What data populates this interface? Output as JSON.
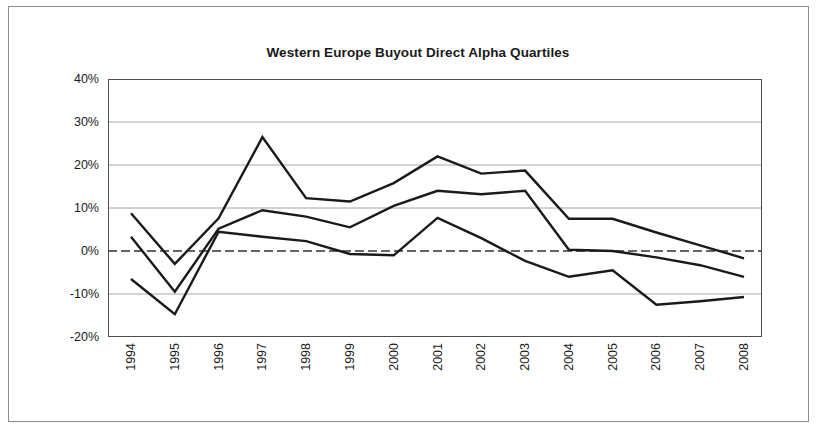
{
  "figure": {
    "title": "Western Europe Buyout Direct Alpha Quartiles"
  },
  "axis": {
    "y_ticks": [
      "40%",
      "30%",
      "20%",
      "10%",
      "0%",
      "-10%",
      "-20%"
    ],
    "x_ticks": [
      "1994",
      "1995",
      "1996",
      "1997",
      "1998",
      "1999",
      "2000",
      "2001",
      "2002",
      "2003",
      "2004",
      "2005",
      "2006",
      "2007",
      "2008"
    ]
  },
  "colors": {
    "line": "#1a1a1a",
    "grid": "#a6a6a6",
    "zero_line": "#333333",
    "frame": "#8c8c8c",
    "axis": "#4d4d4d"
  },
  "chart_data": {
    "type": "line",
    "title": "Western Europe Buyout Direct Alpha Quartiles",
    "xlabel": "",
    "ylabel": "",
    "x": [
      "1994",
      "1995",
      "1996",
      "1997",
      "1998",
      "1999",
      "2000",
      "2001",
      "2002",
      "2003",
      "2004",
      "2005",
      "2006",
      "2007",
      "2008"
    ],
    "ylim": [
      -20,
      40
    ],
    "ytick_values": [
      40,
      30,
      20,
      10,
      0,
      -10,
      -20
    ],
    "ytick_format": "percent",
    "grid": true,
    "legend": "none",
    "zero_reference_line": 0,
    "series": [
      {
        "name": "Top Quartile",
        "values": [
          8.8,
          -3.0,
          7.6,
          26.5,
          12.3,
          11.5,
          15.8,
          22.0,
          18.0,
          18.7,
          7.5,
          7.5,
          4.3,
          1.3,
          -1.7
        ]
      },
      {
        "name": "Median",
        "values": [
          3.3,
          -9.5,
          5.2,
          9.5,
          8.0,
          5.5,
          10.5,
          14.0,
          13.2,
          14.0,
          0.3,
          0.0,
          -1.5,
          -3.3,
          -6.0
        ]
      },
      {
        "name": "Bottom Quartile",
        "values": [
          -6.5,
          -14.7,
          4.5,
          3.3,
          2.3,
          -0.7,
          -1.0,
          7.7,
          3.0,
          -2.3,
          -6.0,
          -4.5,
          -12.5,
          -11.7,
          -10.7
        ]
      }
    ]
  }
}
